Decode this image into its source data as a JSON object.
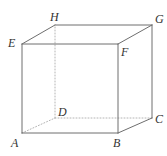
{
  "figure": {
    "name": "cube-abcdefgh",
    "width": 167,
    "height": 156,
    "background_color": "#ffffff",
    "line_color": "#6e6e6e",
    "hidden_line_color": "#b4b4b4",
    "label_color": "#333333",
    "stroke_width": 1,
    "hidden_stroke_width": 1,
    "hidden_dash_pattern": "1,2"
  },
  "vertices": [
    {
      "id": "A",
      "label": "A",
      "x": 22,
      "y": 133,
      "label_x": 11,
      "label_y": 137,
      "face": "front-bottom-left",
      "hidden": false
    },
    {
      "id": "B",
      "label": "B",
      "x": 118,
      "y": 133,
      "label_x": 113,
      "label_y": 137,
      "face": "front-bottom-right",
      "hidden": false
    },
    {
      "id": "C",
      "label": "C",
      "x": 152,
      "y": 118,
      "label_x": 155,
      "label_y": 113,
      "face": "back-bottom-right",
      "hidden": false
    },
    {
      "id": "D",
      "label": "D",
      "x": 55,
      "y": 118,
      "label_x": 58,
      "label_y": 106,
      "face": "back-bottom-left",
      "hidden": true
    },
    {
      "id": "E",
      "label": "E",
      "x": 22,
      "y": 44,
      "label_x": 8,
      "label_y": 37,
      "face": "front-top-left",
      "hidden": false
    },
    {
      "id": "F",
      "label": "F",
      "x": 118,
      "y": 44,
      "label_x": 121,
      "label_y": 46,
      "face": "front-top-right",
      "hidden": false
    },
    {
      "id": "G",
      "label": "G",
      "x": 152,
      "y": 25,
      "label_x": 155,
      "label_y": 13,
      "face": "back-top-right",
      "hidden": false
    },
    {
      "id": "H",
      "label": "H",
      "x": 55,
      "y": 25,
      "label_x": 50,
      "label_y": 11,
      "face": "back-top-left",
      "hidden": false
    }
  ],
  "edges": [
    {
      "id": "AB",
      "from": "A",
      "to": "B",
      "hidden": false,
      "style": "solid"
    },
    {
      "id": "AE",
      "from": "A",
      "to": "E",
      "hidden": false,
      "style": "solid"
    },
    {
      "id": "BF",
      "from": "B",
      "to": "F",
      "hidden": false,
      "style": "solid"
    },
    {
      "id": "EF",
      "from": "E",
      "to": "F",
      "hidden": false,
      "style": "solid"
    },
    {
      "id": "BC",
      "from": "B",
      "to": "C",
      "hidden": false,
      "style": "solid"
    },
    {
      "id": "CG",
      "from": "C",
      "to": "G",
      "hidden": false,
      "style": "solid"
    },
    {
      "id": "FG",
      "from": "F",
      "to": "G",
      "hidden": false,
      "style": "solid"
    },
    {
      "id": "EH",
      "from": "E",
      "to": "H",
      "hidden": false,
      "style": "solid"
    },
    {
      "id": "HG",
      "from": "H",
      "to": "G",
      "hidden": false,
      "style": "solid"
    },
    {
      "id": "AD",
      "from": "A",
      "to": "D",
      "hidden": true,
      "style": "dotted"
    },
    {
      "id": "DC",
      "from": "D",
      "to": "C",
      "hidden": true,
      "style": "dotted"
    },
    {
      "id": "DH",
      "from": "D",
      "to": "H",
      "hidden": true,
      "style": "dotted"
    }
  ]
}
